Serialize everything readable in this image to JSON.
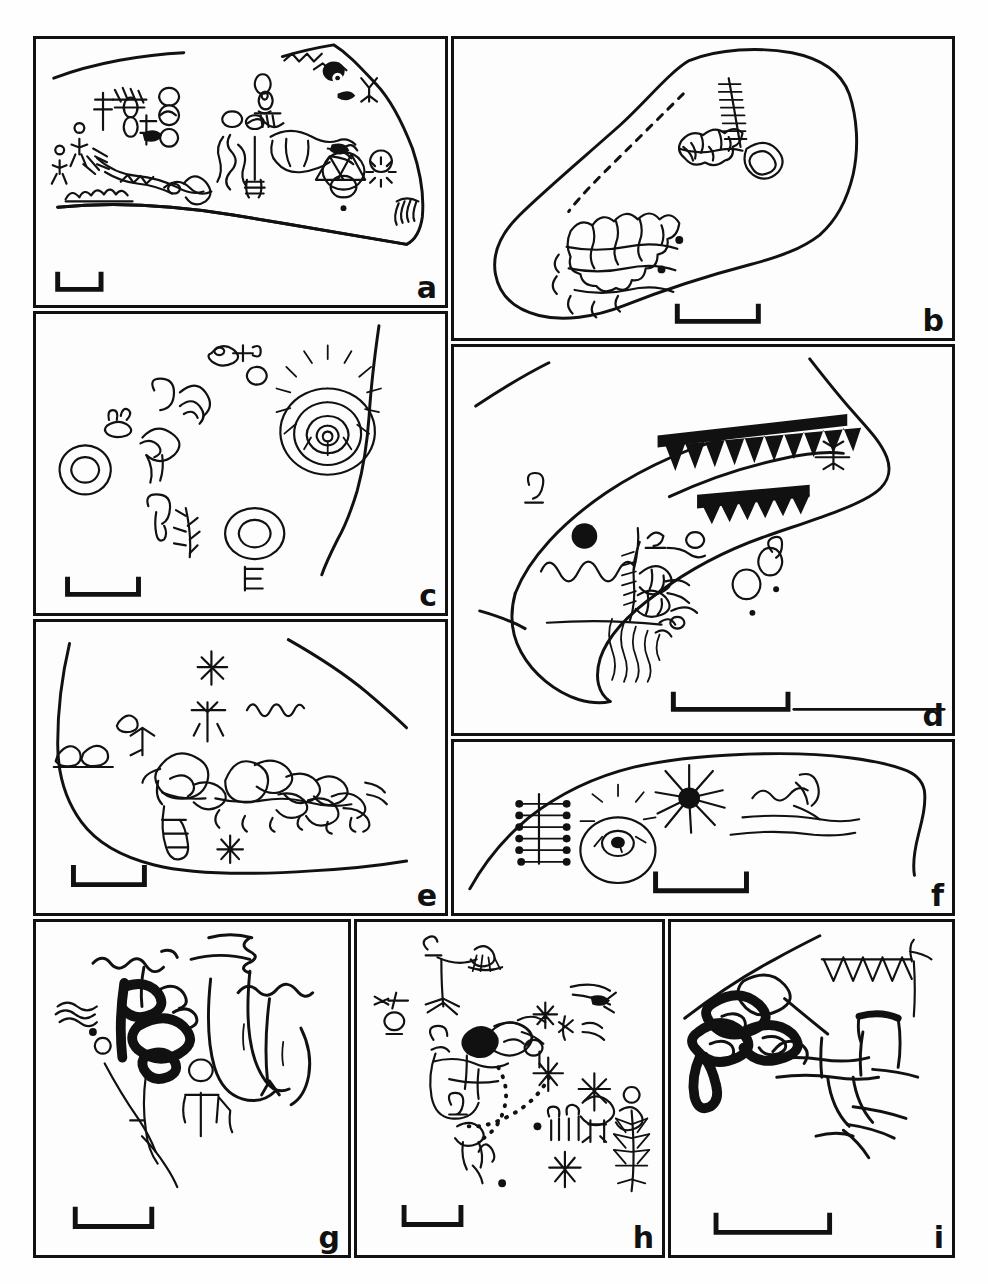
{
  "figure": {
    "type": "multi-panel-line-drawing-plate",
    "panel_count": 9,
    "caption": "",
    "ink_color": "#111111",
    "background_color": "#ffffff",
    "panels": [
      {
        "id": "a",
        "label": "a",
        "description": "Rock surface outline with anthropomorph and zoomorph figures, sun disc, concentric circle and tally marks",
        "scalebar": "bracket",
        "motifs": [
          "anthropomorphs",
          "quadrupeds",
          "sun-disc",
          "concentric-circle",
          "zigzag",
          "tally-marks",
          "comb"
        ]
      },
      {
        "id": "b",
        "label": "b",
        "description": "Boulder outline with dashed seam, cobble mosaic clusters, ladder motif and a closed loop",
        "scalebar": "bracket",
        "motifs": [
          "cobble-mosaic",
          "ladder",
          "loop",
          "dashed-line",
          "cupules"
        ]
      },
      {
        "id": "c",
        "label": "c",
        "description": "Scattered motifs: concentric circles, grid spiral, arcs, bird-like figure and plant form beside a rock edge",
        "scalebar": "bracket",
        "motifs": [
          "grid-spiral",
          "concentric-circles",
          "arcs",
          "bird-figure",
          "plant",
          "arrow",
          "comb"
        ]
      },
      {
        "id": "d",
        "label": "d",
        "description": "Rock outline with two solid sawtooth bands, dot, wavy line and dense tangled figure with trailing lines",
        "scalebar": "bracket",
        "motifs": [
          "sawtooth-band",
          "solid-dot",
          "wavy-line",
          "tangled-figure",
          "dotted-circles"
        ]
      },
      {
        "id": "e",
        "label": "e",
        "description": "Curved rock edge with cobble cluster, stick figure, star motifs and zigzag",
        "scalebar": "bracket",
        "motifs": [
          "cobble-cluster",
          "stick-figure",
          "star",
          "zigzag",
          "tree-motif"
        ]
      },
      {
        "id": "f",
        "label": "f",
        "description": "Long rock edge with comb/rake motif, segmented disc, starburst and horizon lines with a hooked figure",
        "scalebar": "bracket",
        "motifs": [
          "rake",
          "segmented-disc",
          "starburst",
          "hooked-figure",
          "horizon-lines"
        ]
      },
      {
        "id": "g",
        "label": "g",
        "description": "Heavy solid looped glyph with attached line, stick figures, wavy lines and a large curving form",
        "scalebar": "bracket",
        "motifs": [
          "solid-loop-glyph",
          "stick-figures",
          "wavy-lines",
          "large-curve"
        ]
      },
      {
        "id": "h",
        "label": "h",
        "description": "Dense scatter of small anthropomorphs, star motifs, dotted trail, feather/tree motif and solid blot",
        "scalebar": "bracket",
        "motifs": [
          "anthropomorphs",
          "stars",
          "dotted-trail",
          "feather-motif",
          "solid-blot",
          "circles"
        ]
      },
      {
        "id": "i",
        "label": "i",
        "description": "Heavy solid triple-loop glyph joined to a segmented body with splayed legs and a sawtooth line",
        "scalebar": "bracket",
        "motifs": [
          "solid-triple-loop",
          "segmented-body",
          "splayed-legs",
          "sawtooth-line"
        ]
      }
    ]
  }
}
